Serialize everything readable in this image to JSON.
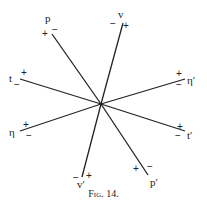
{
  "caption": "Fig. 14.",
  "center": [
    101,
    104
  ],
  "axes": [
    {
      "name": "p",
      "end": [
        52,
        34
      ]
    },
    {
      "name": "v",
      "end": [
        123,
        23
      ]
    },
    {
      "name": "t",
      "end": [
        20,
        79
      ]
    },
    {
      "name": "η′",
      "end": [
        185,
        79
      ]
    },
    {
      "name": "η",
      "end": [
        20,
        131
      ]
    },
    {
      "name": "t′",
      "end": [
        185,
        131
      ]
    },
    {
      "name": "v′",
      "end": [
        82,
        177
      ]
    },
    {
      "name": "p′",
      "end": [
        148,
        175
      ]
    }
  ],
  "labels": {
    "p": "p",
    "v": "v",
    "t": "t",
    "eta_p": "η′",
    "eta": "η",
    "t_p": "t′",
    "v_p": "v′",
    "p_p": "p′"
  },
  "signs": {
    "plus": "+",
    "minus": "−"
  }
}
